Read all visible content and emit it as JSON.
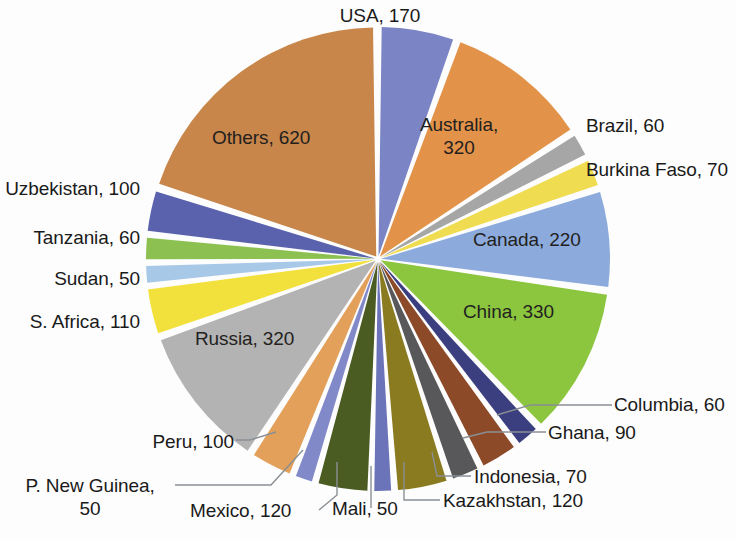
{
  "chart_data": {
    "type": "pie",
    "title": "",
    "total": 2670,
    "units": "",
    "legend_position": "none",
    "labels_show_value": true,
    "label_format": "{name}, {value}",
    "exploded": true,
    "center": {
      "x": 378,
      "y": 259
    },
    "radius": 229,
    "start_angle_deg": -90,
    "gap_deg": 1.6,
    "categories": [
      "USA",
      "Australia",
      "Brazil",
      "Burkina Faso",
      "Canada",
      "China",
      "Columbia",
      "Ghana",
      "Indonesia",
      "Kazakhstan",
      "Mali",
      "Mexico",
      "P. New Guinea",
      "Peru",
      "Russia",
      "S. Africa",
      "Sudan",
      "Tanzania",
      "Uzbekistan",
      "Others"
    ],
    "values": [
      170,
      320,
      60,
      70,
      220,
      330,
      60,
      90,
      70,
      120,
      50,
      120,
      50,
      100,
      320,
      110,
      50,
      60,
      100,
      620
    ],
    "colors": [
      "#7b84c4",
      "#e39349",
      "#a6a6a6",
      "#f0dc50",
      "#8cabdc",
      "#8cc63f",
      "#3b3f7f",
      "#8c4a28",
      "#58585b",
      "#8a7a20",
      "#6b74b8",
      "#4a5c22",
      "#8289c9",
      "#e2a05a",
      "#b3b3b3",
      "#f2e13c",
      "#a8c8e8",
      "#8cc152",
      "#5b62ad",
      "#c8864a"
    ],
    "slices": [
      {
        "name": "USA",
        "value": 170,
        "label": "USA, 170",
        "color": "#7b84c4"
      },
      {
        "name": "Australia",
        "value": 320,
        "label": "Australia, 320",
        "color": "#e39349"
      },
      {
        "name": "Brazil",
        "value": 60,
        "label": "Brazil, 60",
        "color": "#a6a6a6"
      },
      {
        "name": "Burkina Faso",
        "value": 70,
        "label": "Burkina Faso, 70",
        "color": "#f0dc50"
      },
      {
        "name": "Canada",
        "value": 220,
        "label": "Canada, 220",
        "color": "#8cabdc"
      },
      {
        "name": "China",
        "value": 330,
        "label": "China, 330",
        "color": "#8cc63f"
      },
      {
        "name": "Columbia",
        "value": 60,
        "label": "Columbia, 60",
        "color": "#3b3f7f"
      },
      {
        "name": "Ghana",
        "value": 90,
        "label": "Ghana, 90",
        "color": "#8c4a28"
      },
      {
        "name": "Indonesia",
        "value": 70,
        "label": "Indonesia, 70",
        "color": "#58585b"
      },
      {
        "name": "Kazakhstan",
        "value": 120,
        "label": "Kazakhstan, 120",
        "color": "#8a7a20"
      },
      {
        "name": "Mali",
        "value": 50,
        "label": "Mali, 50",
        "color": "#6b74b8"
      },
      {
        "name": "Mexico",
        "value": 120,
        "label": "Mexico, 120",
        "color": "#4a5c22"
      },
      {
        "name": "P. New Guinea",
        "value": 50,
        "label": "P. New Guinea, 50",
        "color": "#8289c9"
      },
      {
        "name": "Peru",
        "value": 100,
        "label": "Peru, 100",
        "color": "#e2a05a"
      },
      {
        "name": "Russia",
        "value": 320,
        "label": "Russia, 320",
        "color": "#b3b3b3"
      },
      {
        "name": "S. Africa",
        "value": 110,
        "label": "S. Africa, 110",
        "color": "#f2e13c"
      },
      {
        "name": "Sudan",
        "value": 50,
        "label": "Sudan, 50",
        "color": "#a8c8e8"
      },
      {
        "name": "Tanzania",
        "value": 60,
        "label": "Tanzania, 60",
        "color": "#8cc152"
      },
      {
        "name": "Uzbekistan",
        "value": 100,
        "label": "Uzbekistan, 100",
        "color": "#5b62ad"
      },
      {
        "name": "Others",
        "value": 620,
        "label": "Others, 620",
        "color": "#c8864a"
      }
    ]
  },
  "labels": {
    "usa": "USA, 170",
    "australia_line1": "Australia,",
    "australia_line2": "320",
    "brazil": "Brazil, 60",
    "burkina_faso": "Burkina Faso, 70",
    "canada": "Canada, 220",
    "china": "China, 330",
    "columbia": "Columbia, 60",
    "ghana": "Ghana, 90",
    "indonesia": "Indonesia, 70",
    "kazakhstan": "Kazakhstan, 120",
    "mali": "Mali, 50",
    "mexico": "Mexico, 120",
    "png_line1": "P. New Guinea,",
    "png_line2": "50",
    "peru": "Peru, 100",
    "russia": "Russia, 320",
    "s_africa": "S. Africa, 110",
    "sudan": "Sudan, 50",
    "tanzania": "Tanzania, 60",
    "uzbekistan": "Uzbekistan, 100",
    "others": "Others, 620"
  }
}
